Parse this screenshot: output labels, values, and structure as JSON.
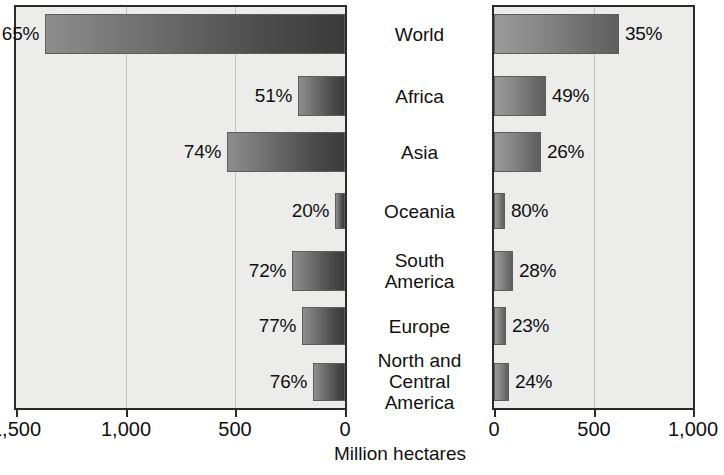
{
  "chart_data": {
    "type": "bar",
    "title": "",
    "subtitle": "",
    "xlabel": "Million hectares",
    "ylabel": "",
    "orientation": "horizontal",
    "layout": "back-to-back paired panels sharing centered category labels",
    "grid": true,
    "legend": null,
    "categories": [
      "World",
      "Africa",
      "Asia",
      "Oceania",
      "South\nAmerica",
      "Europe",
      "North and\nCentral\nAmerica"
    ],
    "panels": [
      {
        "name": "left",
        "direction": "right-to-left",
        "xlim": [
          0,
          1500
        ],
        "axis_reversed": true,
        "ticks": [
          1500,
          1000,
          500,
          0
        ],
        "tick_labels": [
          "1,500",
          "1,000",
          "500",
          "0"
        ],
        "values": [
          1370,
          215,
          540,
          45,
          240,
          195,
          145
        ],
        "data_labels": [
          "65%",
          "51%",
          "74%",
          "20%",
          "72%",
          "77%",
          "76%"
        ],
        "percent_values": [
          65,
          51,
          74,
          20,
          72,
          77,
          76
        ]
      },
      {
        "name": "right",
        "direction": "left-to-right",
        "xlim": [
          0,
          1000
        ],
        "axis_reversed": false,
        "ticks": [
          0,
          500,
          1000
        ],
        "tick_labels": [
          "0",
          "500",
          "1,000"
        ],
        "values": [
          630,
          260,
          235,
          55,
          95,
          60,
          75
        ],
        "data_labels": [
          "35%",
          "49%",
          "26%",
          "80%",
          "28%",
          "23%",
          "24%"
        ],
        "percent_values": [
          35,
          49,
          26,
          80,
          28,
          23,
          24
        ]
      }
    ],
    "colors": {
      "plot_background": "#ececeb",
      "frame": "#2b2b2b",
      "gridline": "#c2c2c0",
      "bar_left_light": "#8d8d8d",
      "bar_left_dark": "#3a3a3a",
      "bar_right_light": "#9a9a9a",
      "bar_right_dark": "#5e5e5e",
      "text": "#111111",
      "page_background": "#ffffff"
    }
  }
}
